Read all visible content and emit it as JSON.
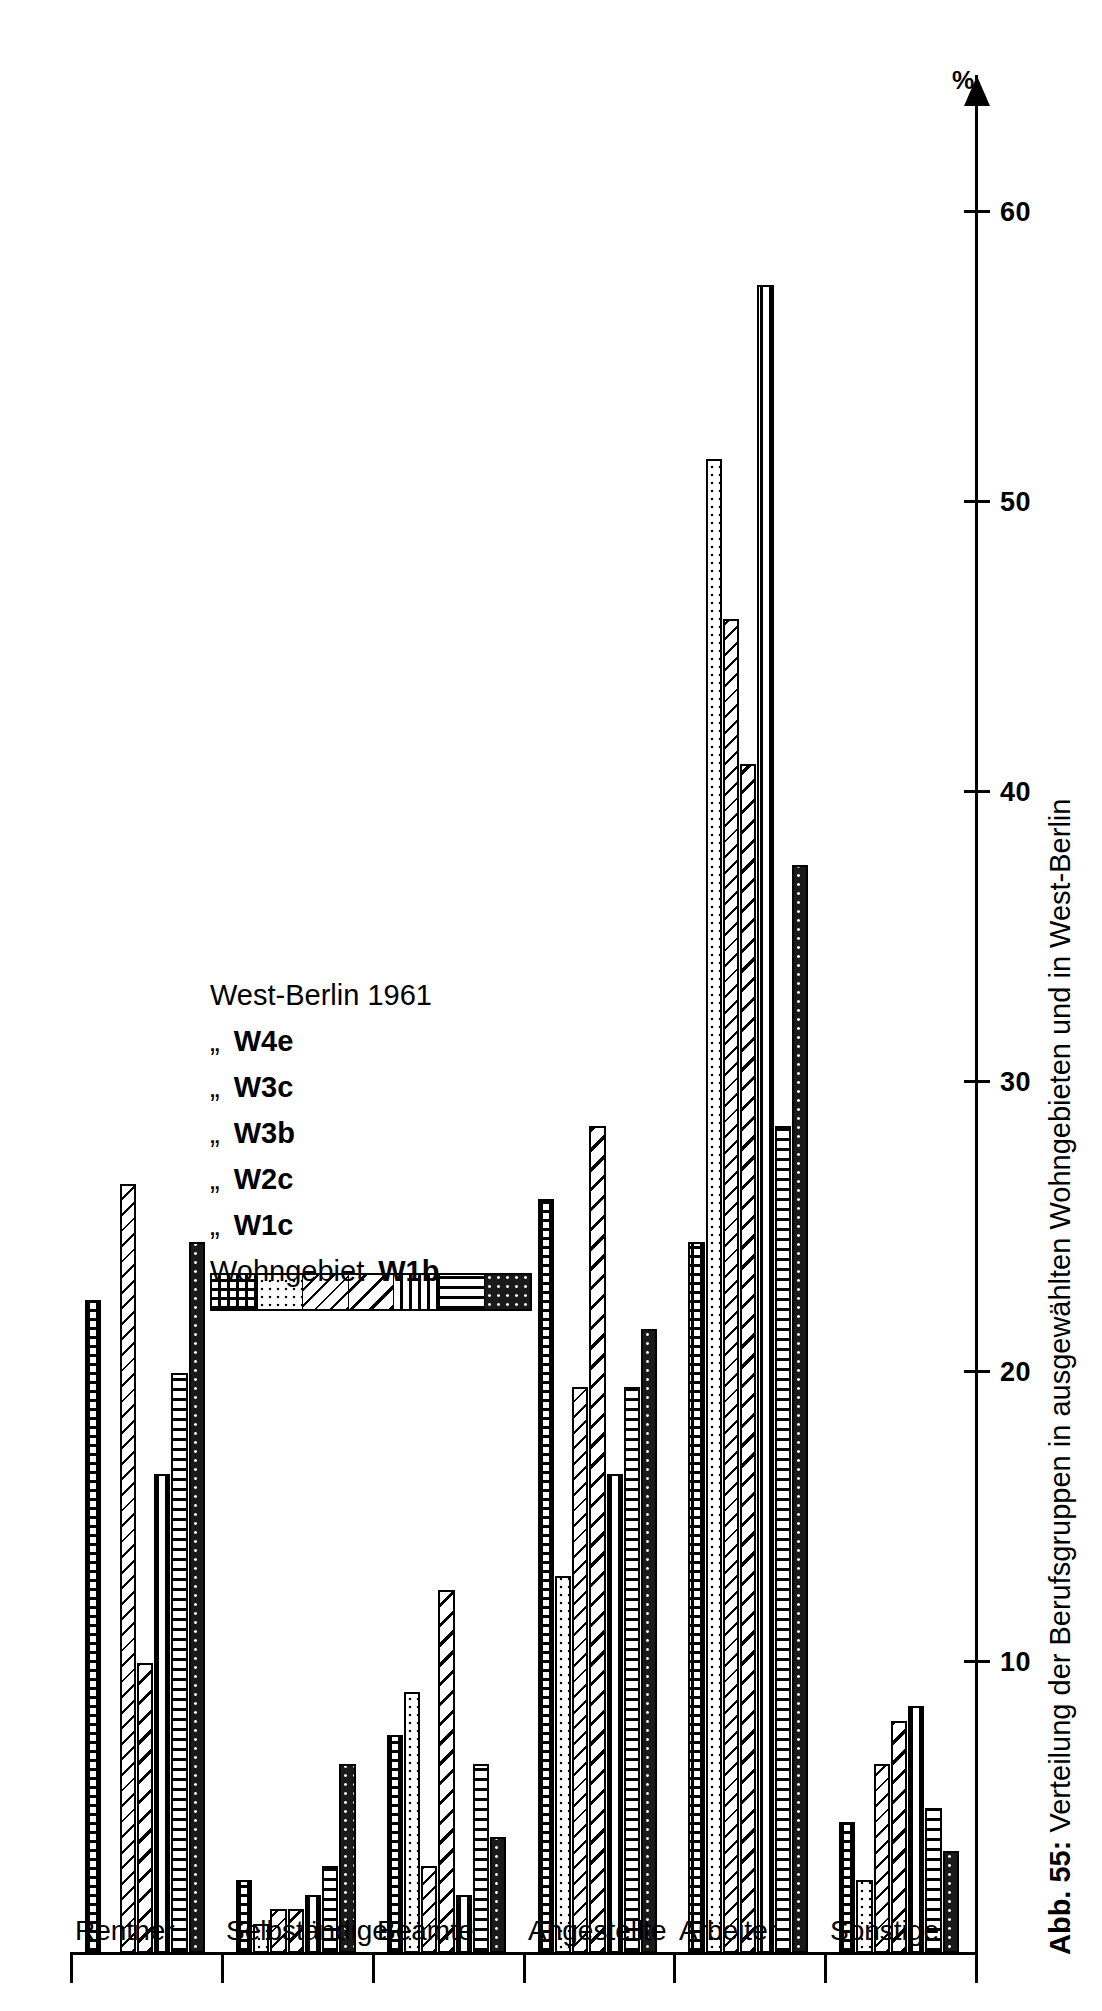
{
  "figure": {
    "caption_label": "Abb. 55:",
    "caption_text": " Verteilung der Berufsgruppen in ausgewählten Wohngebieten und in West-Berlin"
  },
  "axis": {
    "unit_symbol": "%",
    "tick_labels": [
      "10",
      "20",
      "30",
      "40",
      "50",
      "60"
    ],
    "tick_values": [
      10,
      20,
      30,
      40,
      50,
      60
    ]
  },
  "legend": {
    "title_row_name": "Wohngebiet",
    "ditto_mark": "„",
    "rows": [
      {
        "name": "Wohngebiet",
        "code": "W1b",
        "pattern": "grid"
      },
      {
        "name": "„",
        "code": "W1c",
        "pattern": "dots-fine"
      },
      {
        "name": "„",
        "code": "W2c",
        "pattern": "diagonal-thin"
      },
      {
        "name": "„",
        "code": "W3b",
        "pattern": "diagonal-wide"
      },
      {
        "name": "„",
        "code": "W3c",
        "pattern": "horizontal-lines"
      },
      {
        "name": "„",
        "code": "W4e",
        "pattern": "vertical-lines"
      },
      {
        "name": "West-Berlin 1961",
        "code": "",
        "pattern": "dots-dark"
      }
    ]
  },
  "chart_data": {
    "type": "bar",
    "orientation": "horizontal",
    "title": "Verteilung der Berufsgruppen in ausgewählten Wohngebieten und in West-Berlin",
    "xlabel": "",
    "ylabel": "%",
    "ylim": [
      0,
      65
    ],
    "grid": false,
    "legend_position": "inside-left",
    "categories": [
      "Rentner",
      "Selbständige",
      "Beamte",
      "Angestellte",
      "Arbeiter",
      "Sonstige"
    ],
    "series": [
      {
        "name": "Wohngebiet W1b",
        "pattern": "grid",
        "values": [
          22.5,
          2.5,
          7.5,
          26.0,
          24.5,
          4.5
        ]
      },
      {
        "name": "W1c",
        "pattern": "dots-fine",
        "values": [
          0.0,
          1.0,
          9.0,
          13.0,
          51.5,
          2.5
        ]
      },
      {
        "name": "W2c",
        "pattern": "diagonal-thin",
        "values": [
          26.5,
          1.5,
          3.0,
          19.5,
          46.0,
          6.5
        ]
      },
      {
        "name": "W3b",
        "pattern": "diagonal-wide",
        "values": [
          10.0,
          1.5,
          12.5,
          28.5,
          41.0,
          8.0
        ]
      },
      {
        "name": "W3c",
        "pattern": "horizontal-lines",
        "values": [
          16.5,
          2.0,
          2.0,
          16.5,
          57.5,
          8.5
        ]
      },
      {
        "name": "W4e",
        "pattern": "vertical-lines",
        "values": [
          20.0,
          3.0,
          6.5,
          19.5,
          28.5,
          5.0
        ]
      },
      {
        "name": "West-Berlin 1961",
        "pattern": "dots-dark",
        "values": [
          24.5,
          6.5,
          4.0,
          21.5,
          37.5,
          3.5
        ]
      }
    ]
  }
}
